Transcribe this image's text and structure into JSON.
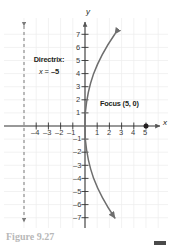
{
  "figure": {
    "caption": "Figure 9.27",
    "caption_visible": "partially cropped"
  },
  "chart_data": {
    "type": "line",
    "title": "",
    "subtitle": "",
    "xlabel": "x",
    "ylabel": "y",
    "xlim": [
      -5.6,
      6.0
    ],
    "ylim": [
      -8.0,
      8.0
    ],
    "grid": true,
    "grid_spacing": 1,
    "legend": "none",
    "x_ticks": [
      -4,
      -3,
      -2,
      -1,
      1,
      2,
      3,
      4,
      5
    ],
    "x_tick_labels": [
      "–4",
      "–3",
      "–2",
      "–1",
      "1",
      "2",
      "3",
      "4",
      "5"
    ],
    "y_ticks": [
      7,
      6,
      5,
      4,
      3,
      2,
      1,
      -1,
      -2,
      -3,
      -4,
      -5,
      -6,
      -7
    ],
    "y_tick_labels": [
      "7",
      "6",
      "5",
      "4",
      "3",
      "2",
      "1",
      "–1",
      "–2",
      "–3",
      "–4",
      "–5",
      "–6",
      "–7"
    ],
    "series": [
      {
        "name": "parabola",
        "equation": "y^2 = 20x",
        "opens": "right",
        "vertex": [
          0,
          0
        ],
        "color": "#6e6e6e",
        "arrow_both_ends": true,
        "points": [
          [
            2.45,
            -7.0
          ],
          [
            1.8,
            -6.0
          ],
          [
            1.25,
            -5.0
          ],
          [
            0.8,
            -4.0
          ],
          [
            0.45,
            -3.0
          ],
          [
            0.2,
            -2.0
          ],
          [
            0.05,
            -1.0
          ],
          [
            0.0,
            0.0
          ],
          [
            0.05,
            1.0
          ],
          [
            0.2,
            2.0
          ],
          [
            0.45,
            3.0
          ],
          [
            0.8,
            4.0
          ],
          [
            1.25,
            5.0
          ],
          [
            1.8,
            6.0
          ],
          [
            2.45,
            7.0
          ]
        ]
      }
    ],
    "annotations": [
      {
        "name": "focus",
        "label": "Focus (5, 0)",
        "point": [
          5,
          0
        ],
        "marker": "filled-circle",
        "color": "#231f20"
      },
      {
        "name": "directrix",
        "label_line1": "Directrix:",
        "label_line2": "x = –5",
        "equation": "x = -5",
        "x": -5,
        "style": "dashed-vertical-line",
        "arrow_both_ends": true,
        "color": "#6e6e6e"
      }
    ]
  },
  "colors": {
    "background": "#ffffff",
    "axis": "#333333",
    "grid": "#ebebeb",
    "curve": "#6e6e6e",
    "text": "#231f20"
  }
}
